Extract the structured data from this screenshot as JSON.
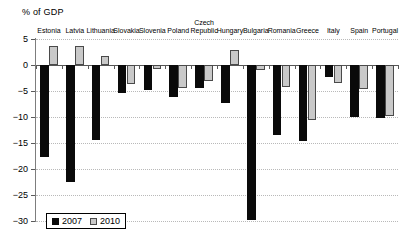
{
  "chart_data": {
    "type": "bar",
    "title": "",
    "ylabel": "% of GDP",
    "xlabel": "",
    "ylim": [
      -30,
      5
    ],
    "yticks": [
      5,
      0,
      -5,
      -10,
      -15,
      -20,
      -25,
      -30
    ],
    "ytick_labels": [
      "5",
      "0",
      "−5",
      "−10",
      "−15",
      "−20",
      "−25",
      "−30"
    ],
    "grid": true,
    "legend_position": "bottom-left",
    "categories": [
      "Estonia",
      "Latvia",
      "Lithuania",
      "Slovakia",
      "Slovenia",
      "Poland",
      "Czech Republic",
      "Hungary",
      "Bulgaria",
      "Romania",
      "Greece",
      "Italy",
      "Spain",
      "Portugal"
    ],
    "series": [
      {
        "name": "2007",
        "color": "#0a0a0a",
        "values": [
          -17.7,
          -22.5,
          -14.4,
          -5.3,
          -4.8,
          -6.2,
          -4.4,
          -7.4,
          -29.8,
          -13.4,
          -14.6,
          -2.4,
          -10.0,
          -10.1
        ]
      },
      {
        "name": "2010",
        "color": "#c9c9c9",
        "values": [
          3.6,
          3.6,
          1.8,
          -3.7,
          -0.8,
          -4.5,
          -3.1,
          2.9,
          -1.0,
          -4.3,
          -10.5,
          -3.5,
          -4.6,
          -9.9
        ]
      }
    ]
  },
  "legend": {
    "items": [
      {
        "label": "2007"
      },
      {
        "label": "2010"
      }
    ]
  },
  "axis": {
    "title": "% of GDP"
  }
}
